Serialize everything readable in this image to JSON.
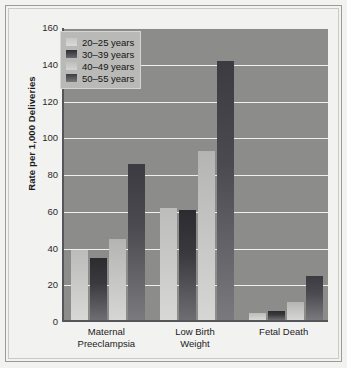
{
  "chart_data": {
    "type": "bar",
    "title": "",
    "xlabel": "",
    "ylabel": "Rate per 1,000 Deliveries",
    "ylim": [
      0,
      160
    ],
    "ytick_step": 20,
    "yticks": [
      160,
      140,
      120,
      100,
      80,
      60,
      40,
      20,
      0
    ],
    "grid": true,
    "legend_position": "top-left inside plot",
    "categories": [
      "Maternal Preeclampsia",
      "Low Birth Weight",
      "Fetal Death"
    ],
    "category_lines": [
      [
        "Maternal",
        "Preeclampsia"
      ],
      [
        "Low Birth",
        "Weight"
      ],
      [
        "Fetal Death"
      ]
    ],
    "series": [
      {
        "name": "20–25 years",
        "values": [
          38,
          61,
          4
        ],
        "color": "#c8c8c6"
      },
      {
        "name": "30–39 years",
        "values": [
          34,
          60,
          5
        ],
        "color": "#3a3a3e"
      },
      {
        "name": "40–49 years",
        "values": [
          44,
          92,
          10
        ],
        "color": "#c4c4c2"
      },
      {
        "name": "50–55 years",
        "values": [
          85,
          141,
          24
        ],
        "color": "#4a4a50"
      }
    ]
  },
  "legend": {
    "items": [
      {
        "label": "20–25 years"
      },
      {
        "label": "30–39 years"
      },
      {
        "label": "40–49 years"
      },
      {
        "label": "50–55 years"
      }
    ]
  },
  "axes": {
    "y_title": "Rate per 1,000 Deliveries",
    "y_labels": [
      "160",
      "140",
      "120",
      "100",
      "80",
      "60",
      "40",
      "20",
      "0"
    ]
  },
  "colors": {
    "plot_background": "#8c8c8a",
    "page_background": "#f2f2f0",
    "gridline": "#efefee",
    "axis": "#55555a",
    "legend_background": "#b9b9b7"
  }
}
